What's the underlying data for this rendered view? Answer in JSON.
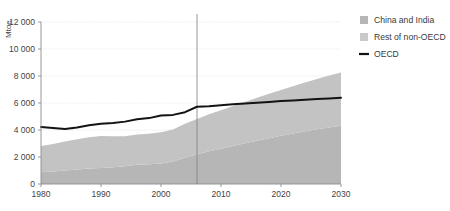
{
  "chart_data": {
    "type": "area",
    "title": "",
    "xlabel": "",
    "ylabel": "Mtoe",
    "xlim": [
      1980,
      2030
    ],
    "ylim": [
      0,
      12000
    ],
    "ytick_labels": [
      "12 000",
      "10 000",
      "8 000",
      "6 000",
      "4 000",
      "2 000",
      "0"
    ],
    "ytick_values": [
      12000,
      10000,
      8000,
      6000,
      4000,
      2000,
      0
    ],
    "xtick_labels": [
      "1980",
      "1990",
      "2000",
      "2010",
      "2020",
      "2030"
    ],
    "xtick_values": [
      1980,
      1990,
      2000,
      2010,
      2020,
      2030
    ],
    "grid": true,
    "legend_position": "right",
    "stacked": true,
    "projection_divider_year": 2006,
    "x": [
      1980,
      1982,
      1984,
      1986,
      1988,
      1990,
      1992,
      1994,
      1996,
      1998,
      2000,
      2002,
      2004,
      2006,
      2008,
      2010,
      2012,
      2014,
      2016,
      2018,
      2020,
      2022,
      2024,
      2026,
      2028,
      2030
    ],
    "series": [
      {
        "name": "China and India",
        "color": "#b6b6b6",
        "values": [
          870,
          930,
          1000,
          1070,
          1140,
          1180,
          1240,
          1320,
          1420,
          1460,
          1520,
          1660,
          1950,
          2200,
          2420,
          2620,
          2820,
          3010,
          3200,
          3390,
          3570,
          3740,
          3900,
          4050,
          4190,
          4320
        ]
      },
      {
        "name": "Rest of non-OECD",
        "color": "#c3c3c3",
        "values": [
          1950,
          2040,
          2150,
          2240,
          2330,
          2380,
          2290,
          2220,
          2250,
          2260,
          2310,
          2380,
          2510,
          2620,
          2740,
          2850,
          2960,
          3070,
          3180,
          3290,
          3400,
          3510,
          3620,
          3730,
          3840,
          3940
        ]
      }
    ],
    "line_series": [
      {
        "name": "OECD",
        "color": "#131313",
        "values": [
          4220,
          4150,
          4070,
          4190,
          4350,
          4460,
          4520,
          4620,
          4800,
          4880,
          5080,
          5120,
          5320,
          5720,
          5760,
          5830,
          5900,
          5960,
          6020,
          6080,
          6140,
          6190,
          6240,
          6290,
          6340,
          6390
        ]
      }
    ],
    "legend": [
      {
        "label": "China and India",
        "type": "area",
        "color": "#b6b6b6"
      },
      {
        "label": "Rest of non-OECD",
        "type": "area",
        "color": "#c9c9c9"
      },
      {
        "label": "OECD",
        "type": "line",
        "color": "#131313"
      }
    ]
  }
}
